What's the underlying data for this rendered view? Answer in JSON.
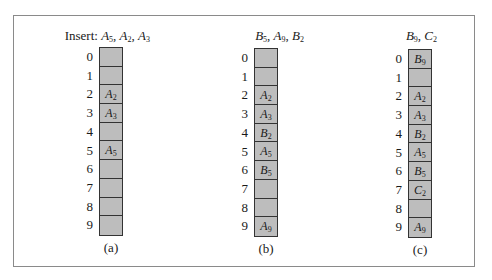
{
  "figure": {
    "panels": [
      {
        "id": "a",
        "header_prefix": "Insert: ",
        "header_keys": [
          {
            "letter": "A",
            "sub": "5"
          },
          {
            "letter": "A",
            "sub": "2"
          },
          {
            "letter": "A",
            "sub": "3"
          }
        ],
        "caption": "(a)",
        "slots": [
          {
            "index": "0",
            "letter": "",
            "sub": ""
          },
          {
            "index": "1",
            "letter": "",
            "sub": ""
          },
          {
            "index": "2",
            "letter": "A",
            "sub": "2"
          },
          {
            "index": "3",
            "letter": "A",
            "sub": "3"
          },
          {
            "index": "4",
            "letter": "",
            "sub": ""
          },
          {
            "index": "5",
            "letter": "A",
            "sub": "5"
          },
          {
            "index": "6",
            "letter": "",
            "sub": ""
          },
          {
            "index": "7",
            "letter": "",
            "sub": ""
          },
          {
            "index": "8",
            "letter": "",
            "sub": ""
          },
          {
            "index": "9",
            "letter": "",
            "sub": ""
          }
        ]
      },
      {
        "id": "b",
        "header_prefix": "",
        "header_keys": [
          {
            "letter": "B",
            "sub": "5"
          },
          {
            "letter": "A",
            "sub": "9"
          },
          {
            "letter": "B",
            "sub": "2"
          }
        ],
        "caption": "(b)",
        "slots": [
          {
            "index": "0",
            "letter": "",
            "sub": ""
          },
          {
            "index": "1",
            "letter": "",
            "sub": ""
          },
          {
            "index": "2",
            "letter": "A",
            "sub": "2"
          },
          {
            "index": "3",
            "letter": "A",
            "sub": "3"
          },
          {
            "index": "4",
            "letter": "B",
            "sub": "2"
          },
          {
            "index": "5",
            "letter": "A",
            "sub": "5"
          },
          {
            "index": "6",
            "letter": "B",
            "sub": "5"
          },
          {
            "index": "7",
            "letter": "",
            "sub": ""
          },
          {
            "index": "8",
            "letter": "",
            "sub": ""
          },
          {
            "index": "9",
            "letter": "A",
            "sub": "9"
          }
        ]
      },
      {
        "id": "c",
        "header_prefix": "",
        "header_keys": [
          {
            "letter": "B",
            "sub": "9"
          },
          {
            "letter": "C",
            "sub": "2"
          }
        ],
        "caption": "(c)",
        "slots": [
          {
            "index": "0",
            "letter": "B",
            "sub": "9"
          },
          {
            "index": "1",
            "letter": "",
            "sub": ""
          },
          {
            "index": "2",
            "letter": "A",
            "sub": "2"
          },
          {
            "index": "3",
            "letter": "A",
            "sub": "3"
          },
          {
            "index": "4",
            "letter": "B",
            "sub": "2"
          },
          {
            "index": "5",
            "letter": "A",
            "sub": "5"
          },
          {
            "index": "6",
            "letter": "B",
            "sub": "5"
          },
          {
            "index": "7",
            "letter": "C",
            "sub": "2"
          },
          {
            "index": "8",
            "letter": "",
            "sub": ""
          },
          {
            "index": "9",
            "letter": "A",
            "sub": "9"
          }
        ]
      }
    ],
    "colors": {
      "cell_fill": "#bdbdbd",
      "cell_border": "#333333",
      "frame_border": "#8a8a8a"
    }
  }
}
